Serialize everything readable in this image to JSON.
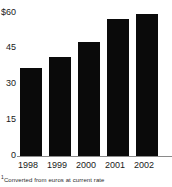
{
  "chart_data": {
    "type": "bar",
    "title": "",
    "subtitle": "",
    "xlabel": "",
    "ylabel": "",
    "categories": [
      "1998",
      "1999",
      "2000",
      "2001",
      "2002"
    ],
    "values": [
      37,
      41.5,
      48,
      57.5,
      59.5
    ],
    "series": [
      {
        "name": "Sales",
        "values": [
          37,
          41.5,
          48,
          57.5,
          59.5
        ]
      }
    ],
    "ylim": [
      0,
      60
    ],
    "yticks": [
      0,
      15,
      30,
      45,
      60
    ],
    "ytick_labels": [
      "0",
      "15",
      "30",
      "45",
      "$60"
    ],
    "grid": false,
    "legend": false,
    "legend_position": "none",
    "bar_color": "#0a0a0a",
    "axis_color": "#8a8a8a",
    "background_color": "#ffffff",
    "annotations": [
      {
        "name": "footnote",
        "marker": "1",
        "text": "Converted from euros at current rate"
      }
    ]
  },
  "axes": {
    "y": {
      "ticks": [
        {
          "label": "$60",
          "value": 60
        },
        {
          "label": "45",
          "value": 45
        },
        {
          "label": "30",
          "value": 30
        },
        {
          "label": "15",
          "value": 15
        },
        {
          "label": "0",
          "value": 0
        }
      ]
    },
    "x": {
      "ticks": [
        {
          "label": "1998"
        },
        {
          "label": "1999"
        },
        {
          "label": "2000"
        },
        {
          "label": "2001"
        },
        {
          "label": "2002"
        }
      ]
    }
  },
  "footnote": {
    "marker": "1",
    "text": "Converted from euros at current rate"
  }
}
